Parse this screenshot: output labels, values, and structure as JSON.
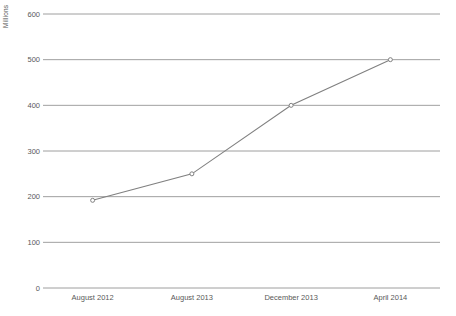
{
  "chart_data": {
    "type": "line",
    "title": "",
    "subtitle": "",
    "xlabel": "",
    "ylabel": "Millions",
    "categories": [
      "August 2012",
      "August 2013",
      "December 2013",
      "April 2014"
    ],
    "values": [
      192,
      250,
      400,
      500
    ],
    "series": [
      {
        "name": "",
        "values": [
          192,
          250,
          400,
          500
        ]
      }
    ],
    "ylim": [
      0,
      600
    ],
    "yticks": [
      0,
      100,
      200,
      300,
      400,
      500,
      600
    ],
    "ytick_labels": [
      "0",
      "100",
      "200",
      "300",
      "400",
      "500",
      "600"
    ],
    "grid": "horizontal",
    "legend": "none",
    "line_color": "#808080",
    "marker_color": "#808080",
    "grid_color": "#868686",
    "text_color": "#595959",
    "background": "#ffffff",
    "annotations": []
  }
}
